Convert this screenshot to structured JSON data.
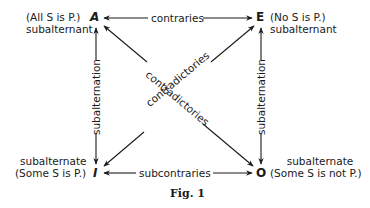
{
  "diagram": {
    "caption": "Fig. 1",
    "corners": {
      "A": {
        "letter": "A",
        "proposition": "(All S is P.)",
        "role": "subalternant"
      },
      "E": {
        "letter": "E",
        "proposition": "(No S is P.)",
        "role": "subalternant"
      },
      "I": {
        "letter": "I",
        "proposition": "(Some S is P.)",
        "role": "subalternate"
      },
      "O": {
        "letter": "O",
        "proposition": "(Some S is not P.)",
        "role": "subalternate"
      }
    },
    "relations": {
      "top": "contraries",
      "bottom": "subcontraries",
      "left": "subalternation",
      "right": "subalternation",
      "diagonal_ao": "contradictories",
      "diagonal_ei": "contradictories"
    },
    "colors": {
      "ink": "#1a1a1a",
      "background": "#ffffff"
    }
  }
}
